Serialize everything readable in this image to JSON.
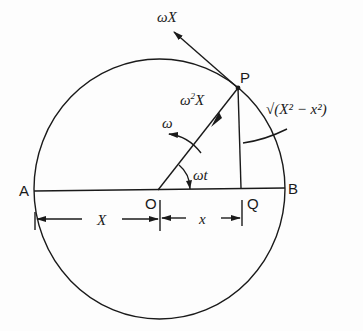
{
  "diagram": {
    "type": "simple-harmonic-motion-reference-circle",
    "points": {
      "A": "A",
      "B": "B",
      "O": "O",
      "P": "P",
      "Q": "Q"
    },
    "labels": {
      "velocity": "ωX",
      "acceleration": "ω²X",
      "acceleration_base": "ω",
      "acceleration_exp": "2",
      "acceleration_var": "X",
      "angular_velocity": "ω",
      "angle": "ωt",
      "height_formula": "√(X² − x²)",
      "amplitude": "X",
      "displacement": "x"
    },
    "colors": {
      "line": "#1a1a1a",
      "background": "#fdfdfd"
    }
  }
}
